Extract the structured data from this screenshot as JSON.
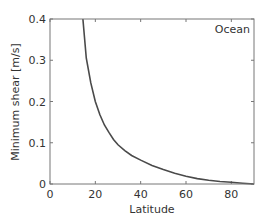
{
  "chart_data": {
    "type": "line",
    "title": "",
    "annotation": "Ocean",
    "xlabel": "Latitude",
    "ylabel": "Minimum shear [m/s]",
    "xlim": [
      0,
      90
    ],
    "ylim": [
      0,
      0.4
    ],
    "xticks": [
      0,
      20,
      40,
      60,
      80
    ],
    "yticks": [
      0,
      0.1,
      0.2,
      0.3,
      0.4
    ],
    "xtick_labels": [
      "0",
      "20",
      "40",
      "60",
      "80"
    ],
    "ytick_labels": [
      "0",
      "0.1",
      "0.2",
      "0.3",
      "0.4"
    ],
    "grid": false,
    "legend": null,
    "series": [
      {
        "name": "Ocean",
        "color": "#4a4a4a",
        "x": [
          14.5,
          16,
          18,
          20,
          22,
          24,
          26,
          28,
          30,
          33,
          36,
          40,
          45,
          50,
          55,
          60,
          65,
          70,
          75,
          80,
          85,
          90
        ],
        "y": [
          0.4,
          0.305,
          0.245,
          0.2,
          0.168,
          0.143,
          0.125,
          0.108,
          0.095,
          0.081,
          0.069,
          0.058,
          0.045,
          0.035,
          0.026,
          0.019,
          0.013,
          0.009,
          0.006,
          0.004,
          0.002,
          0.0
        ]
      }
    ]
  }
}
